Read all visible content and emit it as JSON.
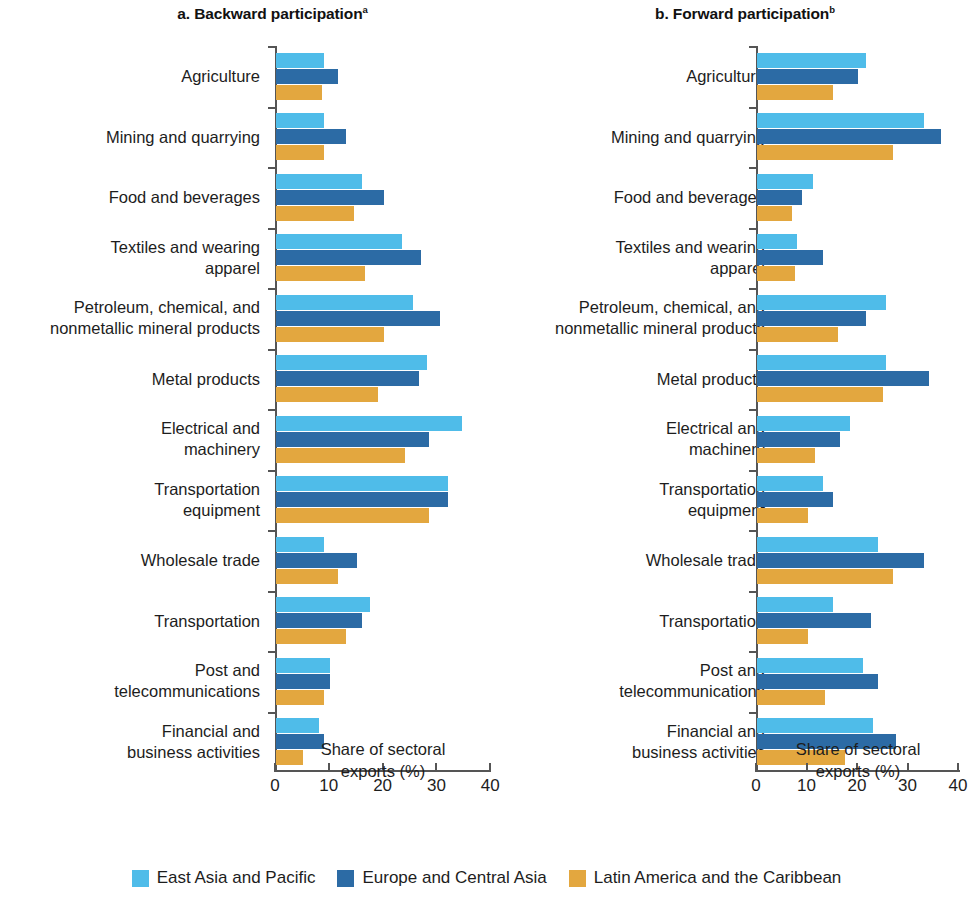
{
  "chart_data": {
    "type": "bar",
    "orientation": "horizontal",
    "title": "",
    "panels": [
      {
        "key": "a",
        "label": "a.",
        "title": "Backward participation",
        "title_superscript": "a",
        "xlabel": "Share of sectoral\nexports (%)",
        "ylabel": "",
        "xlim": [
          0,
          40
        ],
        "xticks": [
          0,
          10,
          20,
          30,
          40
        ],
        "xticklabels": [
          "0",
          "10",
          "20",
          "30",
          "40"
        ],
        "grid": false,
        "categories": [
          "Agriculture",
          "Mining and quarrying",
          "Food and beverages",
          "Textiles and wearing\napparel",
          "Petroleum, chemical, and\nnonmetallic mineral products",
          "Metal products",
          "Electrical and\nmachinery",
          "Transportation\nequipment",
          "Wholesale trade",
          "Transportation",
          "Post and\ntelecommunications",
          "Financial and\nbusiness activities"
        ],
        "series": [
          {
            "name": "East Asia and Pacific",
            "color": "#4FBCE9",
            "values": [
              9.0,
              9.0,
              16.0,
              23.5,
              25.5,
              28.0,
              34.5,
              32.0,
              9.0,
              17.5,
              10.0,
              8.0
            ]
          },
          {
            "name": "Europe and Central Asia",
            "color": "#2C6BA5",
            "values": [
              11.5,
              13.0,
              20.0,
              27.0,
              30.5,
              26.5,
              28.5,
              32.0,
              15.0,
              16.0,
              10.0,
              9.0
            ]
          },
          {
            "name": "Latin America and the Caribbean",
            "color": "#E3A73F",
            "values": [
              8.5,
              9.0,
              14.5,
              16.5,
              20.0,
              19.0,
              24.0,
              28.5,
              11.5,
              13.0,
              9.0,
              5.0
            ]
          }
        ]
      },
      {
        "key": "b",
        "label": "b.",
        "title": "Forward participation",
        "title_superscript": "b",
        "xlabel": "Share of sectoral\nexports (%)",
        "ylabel": "",
        "xlim": [
          0,
          40
        ],
        "xticks": [
          0,
          10,
          20,
          30,
          40
        ],
        "xticklabels": [
          "0",
          "10",
          "20",
          "30",
          "40"
        ],
        "grid": false,
        "categories": [
          "Agriculture",
          "Mining and quarrying",
          "Food and beverages",
          "Textiles and wearing\napparel",
          "Petroleum, chemical, and\nnonmetallic mineral products",
          "Metal products",
          "Electrical and\nmachinery",
          "Transportation\nequipment",
          "Wholesale trade",
          "Transportation",
          "Post and\ntelecommunications",
          "Financial and\nbusiness activities"
        ],
        "series": [
          {
            "name": "East Asia and Pacific",
            "color": "#4FBCE9",
            "values": [
              21.5,
              33.0,
              11.0,
              8.0,
              25.5,
              25.5,
              18.5,
              13.0,
              24.0,
              15.0,
              21.0,
              23.0
            ]
          },
          {
            "name": "Europe and Central Asia",
            "color": "#2C6BA5",
            "values": [
              20.0,
              36.5,
              9.0,
              13.0,
              21.5,
              34.0,
              16.5,
              15.0,
              33.0,
              22.5,
              24.0,
              27.5
            ]
          },
          {
            "name": "Latin America and the Caribbean",
            "color": "#E3A73F",
            "values": [
              15.0,
              27.0,
              7.0,
              7.5,
              16.0,
              25.0,
              11.5,
              10.0,
              27.0,
              10.0,
              13.5,
              17.5
            ]
          }
        ]
      }
    ],
    "legend": {
      "position": "bottom",
      "entries": [
        {
          "label": "East Asia and Pacific",
          "color": "#4FBCE9"
        },
        {
          "label": "Europe and Central Asia",
          "color": "#2C6BA5"
        },
        {
          "label": "Latin America and the Caribbean",
          "color": "#E3A73F"
        }
      ]
    }
  }
}
